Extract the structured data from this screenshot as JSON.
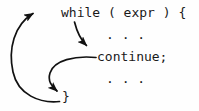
{
  "figure": {
    "background_color": "#fefefe",
    "ink_color": "#1a1a1a",
    "width": 199,
    "height": 111
  },
  "code": {
    "lines": [
      {
        "id": "while-header",
        "text": "while ( expr ) {"
      },
      {
        "id": "body-ellipsis-top",
        "text": ". . ."
      },
      {
        "id": "continue-statement",
        "text": "continue;"
      },
      {
        "id": "body-ellipsis-bottom",
        "text": ". . ."
      },
      {
        "id": "closing-brace",
        "text": "}"
      }
    ]
  },
  "arrows": [
    {
      "id": "loop-back-arrow",
      "label": "from closing brace back to while header",
      "from": "closing-brace",
      "to": "while-header",
      "head_direction": "right"
    },
    {
      "id": "continue-jump-arrow",
      "label": "from while header down to continue statement",
      "from": "while-header",
      "to": "continue-statement",
      "head_direction": "down-right"
    },
    {
      "id": "continue-to-brace-arrow",
      "label": "from continue statement to closing brace",
      "from": "continue-statement",
      "to": "closing-brace",
      "head_direction": "down-left"
    }
  ]
}
